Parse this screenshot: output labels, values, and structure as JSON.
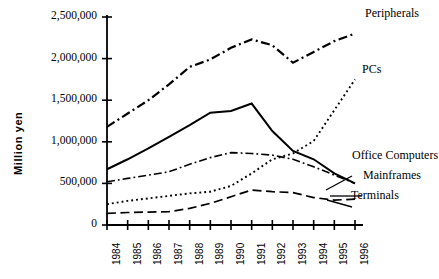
{
  "chart_data": {
    "type": "line",
    "title": "",
    "xlabel": "",
    "ylabel": "Million yen",
    "x": [
      1984,
      1985,
      1986,
      1987,
      1988,
      1989,
      1990,
      1991,
      1992,
      1993,
      1994,
      1995,
      1996
    ],
    "xtick_labels": [
      "1984",
      "1985",
      "1986",
      "1987",
      "1988",
      "1989",
      "1990",
      "1991",
      "1992",
      "1993",
      "1994",
      "1995",
      "1996"
    ],
    "ytick_labels": [
      "2,500,000",
      "2,000,000",
      "1,500,000",
      "1,000,000",
      "500,000",
      "0"
    ],
    "ytick_values": [
      2500000,
      2000000,
      1500000,
      1000000,
      500000,
      0
    ],
    "ylim": [
      0,
      2500000
    ],
    "xlim": [
      1984,
      1996
    ],
    "grid": false,
    "legend_position": "right-inline-annotations",
    "series": [
      {
        "name": "Peripherals",
        "style": "dash-dot-thick",
        "color": "#000000",
        "values": [
          1180000,
          1340000,
          1500000,
          1690000,
          1900000,
          1990000,
          2130000,
          2230000,
          2160000,
          1950000,
          2080000,
          2210000,
          2300000
        ]
      },
      {
        "name": "PCs",
        "style": "dotted",
        "color": "#000000",
        "values": [
          250000,
          290000,
          320000,
          350000,
          380000,
          400000,
          470000,
          620000,
          790000,
          860000,
          1010000,
          1380000,
          1750000
        ]
      },
      {
        "name": "Office Computers",
        "style": "solid",
        "color": "#000000",
        "values": [
          670000,
          790000,
          920000,
          1060000,
          1200000,
          1350000,
          1370000,
          1460000,
          1130000,
          890000,
          790000,
          620000,
          500000
        ]
      },
      {
        "name": "Mainframes",
        "style": "dash-dot-thin",
        "color": "#000000",
        "values": [
          520000,
          560000,
          600000,
          640000,
          730000,
          810000,
          870000,
          860000,
          840000,
          790000,
          700000,
          600000,
          500000
        ]
      },
      {
        "name": "Terminals",
        "style": "long-dash",
        "color": "#000000",
        "values": [
          140000,
          150000,
          155000,
          160000,
          200000,
          260000,
          340000,
          420000,
          400000,
          390000,
          330000,
          300000,
          310000
        ]
      }
    ]
  },
  "axis": {
    "ylabel": "Million yen"
  }
}
